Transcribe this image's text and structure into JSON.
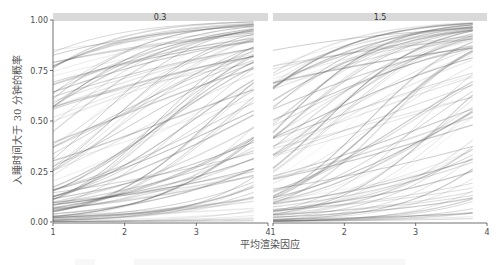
{
  "chart_data": {
    "type": "line",
    "title": "",
    "xlabel": "平均渲染因应",
    "ylabel": "入睡时间大于 30 分钟的概率",
    "ylim": [
      0,
      1
    ],
    "xlim": [
      1,
      4
    ],
    "grid": false,
    "legend": "none",
    "y_ticks": [
      "0.00",
      "0.25",
      "0.50",
      "0.75",
      "1.00"
    ],
    "x_ticks": [
      "1",
      "2",
      "3",
      "4"
    ],
    "facets": [
      {
        "label": "0.3",
        "description": "Posterior draws of logistic curves, x from 1 to ~3.8; probabilities rising with x, mass concentrated near 0 at x=1",
        "x_end": 3.8,
        "series_count": 100
      },
      {
        "label": "1.5",
        "description": "Posterior draws of logistic curves, x from 1 to ~3.8; probabilities rising with x, mass concentrated near 0 at x=1",
        "x_end": 3.8,
        "series_count": 100
      }
    ],
    "line_color": "#555555",
    "line_opacity": 0.18
  },
  "labels": {
    "facet_left": "0.3",
    "facet_right": "1.5",
    "x_title": "平均渲染因应",
    "y_title": "入睡时间大于 30 分钟的概率"
  },
  "colors": {
    "strip": "#d9d9d9",
    "axis": "#4d4d4d",
    "curve": "#555555"
  }
}
